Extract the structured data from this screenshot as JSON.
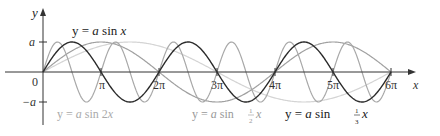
{
  "chart_data": {
    "type": "line",
    "title": "",
    "xlabel": "x",
    "ylabel": "y",
    "origin_label": "0",
    "y_ticks": [
      {
        "value": 1,
        "label": "a"
      },
      {
        "value": -1,
        "label": "−a"
      }
    ],
    "x_ticks": [
      {
        "value": 1,
        "label": "π"
      },
      {
        "value": 2,
        "label": "2π"
      },
      {
        "value": 3,
        "label": "3π"
      },
      {
        "value": 4,
        "label": "4π"
      },
      {
        "value": 5,
        "label": "5π"
      },
      {
        "value": 6,
        "label": "6π"
      }
    ],
    "x_range_pi": [
      0,
      6
    ],
    "y_range_a": [
      -1,
      1
    ],
    "series": [
      {
        "name": "y = a sin x",
        "k": 1,
        "color": "#2b2b2b",
        "label_parts": [
          "y = ",
          "a",
          " sin ",
          "x"
        ]
      },
      {
        "name": "y = a sin 2x",
        "k": 2,
        "color": "#a8a8a8",
        "label_parts": [
          "y = ",
          "a",
          " sin 2",
          "x"
        ]
      },
      {
        "name": "y = a sin (1/2)x",
        "k": 0.5,
        "color": "#8c8c8c",
        "label_parts": [
          "y = ",
          "a",
          " sin ",
          "x"
        ]
      },
      {
        "name": "y = a sin (1/3)x",
        "k": 0.3333,
        "color": "#d0d0d0",
        "label_parts": [
          "y = ",
          "a",
          " sin ",
          "x"
        ]
      }
    ],
    "grid": false,
    "legend": "inline labels"
  },
  "labels": {
    "sin_x": {
      "pre": "y = ",
      "a": "a",
      "mid": " sin ",
      "x": "x"
    },
    "sin_2x": {
      "pre": "y = ",
      "a": "a",
      "mid": " sin 2",
      "x": "x"
    },
    "sin_half_x": {
      "pre": "y = ",
      "a": "a",
      "mid": " sin ",
      "num": "1",
      "den": "2",
      "x": "x"
    },
    "sin_third_x": {
      "pre": "y = ",
      "a": "a",
      "mid": " sin ",
      "num": "1",
      "den": "3",
      "x": "x"
    }
  }
}
